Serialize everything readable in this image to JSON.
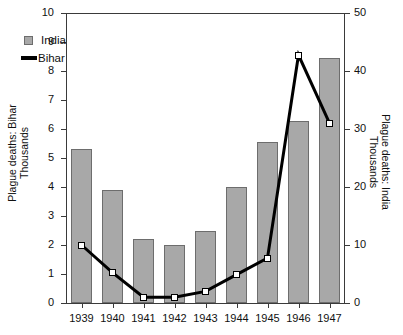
{
  "chart_data": {
    "type": "bar",
    "title": "",
    "subtitle": "",
    "xlabel": "",
    "categories": [
      "1939",
      "1940",
      "1941",
      "1942",
      "1943",
      "1944",
      "1945",
      "1946",
      "1947"
    ],
    "x_tick_labels": [
      "1939",
      "1940",
      "1941",
      "1942",
      "1943",
      "1944",
      "1945",
      "1946",
      "1947"
    ],
    "grid": false,
    "legend_position": "top-left",
    "axes": {
      "left": {
        "label_line1": "Plague deaths: Bihar",
        "label_line2": "Thousands",
        "ylim": [
          0,
          10
        ],
        "ticks": [
          0,
          1,
          2,
          3,
          4,
          5,
          6,
          7,
          8,
          9,
          10
        ],
        "tick_labels": [
          "0",
          "1",
          "2",
          "3",
          "4",
          "5",
          "6",
          "7",
          "8",
          "9",
          "10"
        ]
      },
      "right": {
        "label_line1": "Plague deaths: India",
        "label_line2": "Thousands",
        "ylim": [
          0,
          50
        ],
        "ticks": [
          0,
          10,
          20,
          30,
          40,
          50
        ],
        "tick_labels": [
          "0",
          "10",
          "20",
          "30",
          "40",
          "50"
        ]
      }
    },
    "series": [
      {
        "name": "India",
        "type": "bar",
        "axis": "right",
        "color": "#a8a8a8",
        "edge_color": "#6d6d6d",
        "values_right_axis": [
          26.5,
          19.4,
          11.1,
          10.0,
          12.5,
          20.0,
          27.8,
          31.4,
          42.3
        ],
        "values_left_axis": [
          5.3,
          3.88,
          2.22,
          2.0,
          2.5,
          4.0,
          5.56,
          6.28,
          8.46
        ]
      },
      {
        "name": "Bihar",
        "type": "line",
        "axis": "left",
        "color": "#000000",
        "marker": "open-square",
        "values": [
          2.0,
          1.05,
          0.2,
          0.2,
          0.4,
          0.98,
          1.55,
          8.55,
          6.2
        ]
      }
    ]
  },
  "legend": {
    "items": [
      {
        "label": "India",
        "marker": "filled-square",
        "color": "#a8a8a8"
      },
      {
        "label": "Bihar",
        "marker": "line",
        "color": "#000000"
      }
    ]
  }
}
